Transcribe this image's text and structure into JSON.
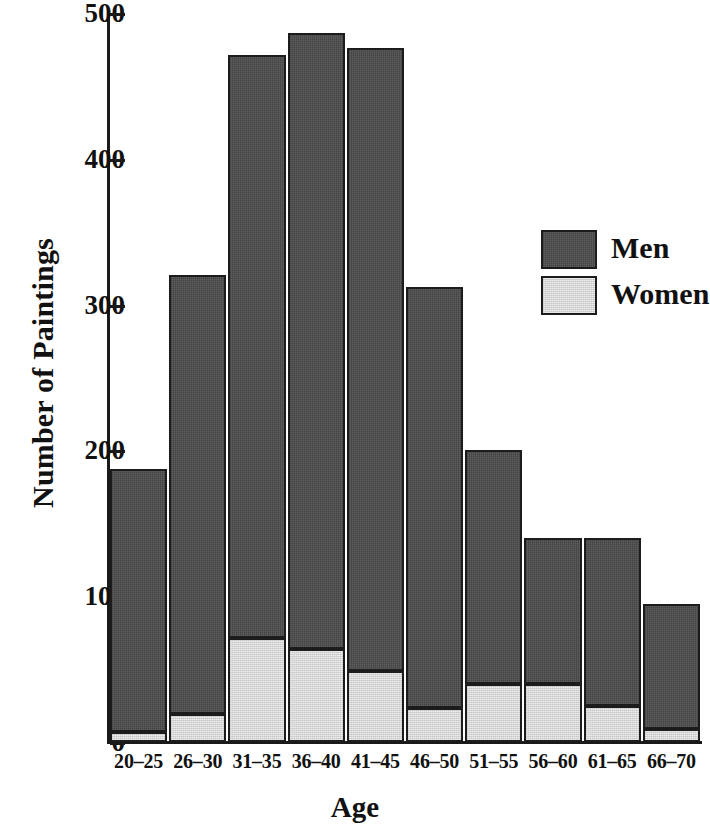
{
  "chart_data": {
    "type": "bar",
    "stacked": true,
    "title": "",
    "xlabel": "Age",
    "ylabel": "Number of Paintings",
    "categories": [
      "20–25",
      "26–30",
      "31–35",
      "36–40",
      "41–45",
      "46–50",
      "51–55",
      "56–60",
      "61–65",
      "66–70"
    ],
    "series": [
      {
        "name": "Men",
        "color": "#4a4a4a",
        "values": [
          180,
          301,
          400,
          422,
          427,
          289,
          160,
          100,
          115,
          86
        ]
      },
      {
        "name": "Women",
        "color": "#d4d4d4",
        "values": [
          7,
          19,
          71,
          64,
          49,
          23,
          40,
          40,
          25,
          9
        ]
      }
    ],
    "totals": [
      187,
      320,
      471,
      486,
      476,
      312,
      200,
      140,
      140,
      95
    ],
    "ylim": [
      0,
      500
    ],
    "yticks": [
      0,
      100,
      200,
      300,
      400,
      500
    ],
    "ytick_labels": [
      "0",
      "100",
      "200",
      "300",
      "400",
      "500"
    ],
    "grid": false,
    "legend_position": "right-upper",
    "legend": [
      "Men",
      "Women"
    ]
  },
  "axis": {
    "y_title": "Number of Paintings",
    "x_title": "Age"
  },
  "legend": {
    "entries": [
      {
        "label": "Men",
        "swatch": "men-swatch"
      },
      {
        "label": "Women",
        "swatch": "women-swatch"
      }
    ]
  }
}
